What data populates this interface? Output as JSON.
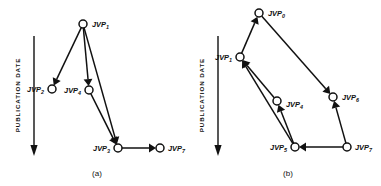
{
  "figure": {
    "title": "",
    "panels": [
      {
        "id": "panel-a",
        "caption": "(a)",
        "axis": {
          "label": "PUBLICATION  DATE",
          "direction": "down"
        },
        "nodes": [
          {
            "id": "a-jvp1",
            "label": "JVP",
            "sub": "1",
            "x": 83,
            "y": 24,
            "label_x": 92,
            "label_y": 24,
            "label_align": "start"
          },
          {
            "id": "a-jvp2",
            "label": "JVP",
            "sub": "2",
            "x": 52,
            "y": 89,
            "label_x": 44,
            "label_y": 89,
            "label_align": "end"
          },
          {
            "id": "a-jvp4",
            "label": "JVP",
            "sub": "4",
            "x": 89,
            "y": 90,
            "label_x": 81,
            "label_y": 90,
            "label_align": "end"
          },
          {
            "id": "a-jvp3",
            "label": "JVP",
            "sub": "3",
            "x": 118,
            "y": 148,
            "label_x": 110,
            "label_y": 148,
            "label_align": "end"
          },
          {
            "id": "a-jvp7",
            "label": "JVP",
            "sub": "7",
            "x": 160,
            "y": 148,
            "label_x": 168,
            "label_y": 148,
            "label_align": "start"
          }
        ],
        "edges": [
          {
            "id": "a-e1",
            "from": "a-jvp1",
            "to": "a-jvp2"
          },
          {
            "id": "a-e2",
            "from": "a-jvp1",
            "to": "a-jvp4"
          },
          {
            "id": "a-e3",
            "from": "a-jvp1",
            "to": "a-jvp3"
          },
          {
            "id": "a-e4",
            "from": "a-jvp4",
            "to": "a-jvp3"
          },
          {
            "id": "a-e5",
            "from": "a-jvp3",
            "to": "a-jvp7"
          }
        ]
      },
      {
        "id": "panel-b",
        "caption": "(b)",
        "axis": {
          "label": "PUBLICATION  DATE",
          "direction": "down"
        },
        "nodes": [
          {
            "id": "b-jvp0",
            "label": "JVP",
            "sub": "0",
            "x": 259,
            "y": 13,
            "label_x": 268,
            "label_y": 13,
            "label_align": "start"
          },
          {
            "id": "b-jvp1",
            "label": "JVP",
            "sub": "1",
            "x": 240,
            "y": 57,
            "label_x": 232,
            "label_y": 57,
            "label_align": "end"
          },
          {
            "id": "b-jvp4",
            "label": "JVP",
            "sub": "4",
            "x": 277,
            "y": 101,
            "label_x": 286,
            "label_y": 104,
            "label_align": "start"
          },
          {
            "id": "b-jvp6",
            "label": "JVP",
            "sub": "6",
            "x": 333,
            "y": 97,
            "label_x": 342,
            "label_y": 97,
            "label_align": "start"
          },
          {
            "id": "b-jvp5",
            "label": "JVP",
            "sub": "5",
            "x": 295,
            "y": 147,
            "label_x": 287,
            "label_y": 147,
            "label_align": "end"
          },
          {
            "id": "b-jvp7",
            "label": "JVP",
            "sub": "7",
            "x": 347,
            "y": 147,
            "label_x": 355,
            "label_y": 147,
            "label_align": "start"
          }
        ],
        "edges": [
          {
            "id": "b-e1",
            "from": "b-jvp1",
            "to": "b-jvp0"
          },
          {
            "id": "b-e2",
            "from": "b-jvp0",
            "to": "b-jvp6"
          },
          {
            "id": "b-e3",
            "from": "b-jvp7",
            "to": "b-jvp6"
          },
          {
            "id": "b-e4",
            "from": "b-jvp7",
            "to": "b-jvp5"
          },
          {
            "id": "b-e5",
            "from": "b-jvp5",
            "to": "b-jvp1"
          },
          {
            "id": "b-e6",
            "from": "b-jvp5",
            "to": "b-jvp4"
          },
          {
            "id": "b-e7",
            "from": "b-jvp4",
            "to": "b-jvp1"
          }
        ]
      }
    ],
    "colors": {
      "ink": "#111111",
      "background": "#ffffff"
    }
  }
}
